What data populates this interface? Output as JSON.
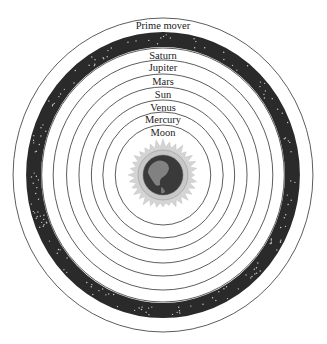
{
  "diagram": {
    "center": {
      "x": 163,
      "y": 175
    },
    "x_scale": 0.955,
    "outer_sphere": {
      "label": "Prime mover",
      "radius": 157
    },
    "starry_band": {
      "inner_radius": 128,
      "outer_radius": 143,
      "color": "#2a2a2a",
      "star_color": "#cfcfcf"
    },
    "spheres": [
      {
        "label": "Saturn",
        "radius": 127
      },
      {
        "label": "Jupiter",
        "radius": 115
      },
      {
        "label": "Mars",
        "radius": 101
      },
      {
        "label": "Sun",
        "radius": 88
      },
      {
        "label": "Venus",
        "radius": 75
      },
      {
        "label": "Mercury",
        "radius": 63
      },
      {
        "label": "Moon",
        "radius": 50
      }
    ],
    "earth": {
      "label": "Earth",
      "radius": 20,
      "ring_radius": 25,
      "halo_radius": 36,
      "ocean_color": "#3a3a3a",
      "land_color": "#8a8a8a",
      "ring_color": "#c8c8c8",
      "halo_color": "#d4d4d4"
    }
  }
}
